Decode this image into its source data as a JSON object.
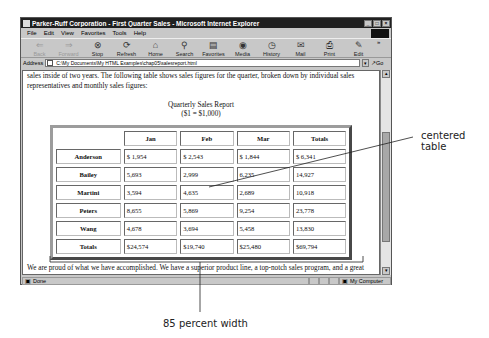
{
  "window": {
    "title": "Parker-Ruff Corporation - First Quarter Sales - Microsoft Internet Explorer",
    "controls": [
      "minimize",
      "maximize",
      "close"
    ]
  },
  "menu": [
    "File",
    "Edit",
    "View",
    "Favorites",
    "Tools",
    "Help"
  ],
  "toolbar": [
    {
      "label": "Back",
      "icon": "back-arrow-icon",
      "enabled": false
    },
    {
      "label": "Forward",
      "icon": "forward-arrow-icon",
      "enabled": false
    },
    {
      "label": "Stop",
      "icon": "stop-icon",
      "enabled": true
    },
    {
      "label": "Refresh",
      "icon": "refresh-icon",
      "enabled": true
    },
    {
      "label": "Home",
      "icon": "home-icon",
      "enabled": true
    },
    {
      "label": "Search",
      "icon": "search-icon",
      "enabled": true
    },
    {
      "label": "Favorites",
      "icon": "favorites-icon",
      "enabled": true
    },
    {
      "label": "Media",
      "icon": "media-icon",
      "enabled": true
    },
    {
      "label": "History",
      "icon": "history-icon",
      "enabled": true
    },
    {
      "label": "Mail",
      "icon": "mail-icon",
      "enabled": true
    },
    {
      "label": "Print",
      "icon": "print-icon",
      "enabled": true
    },
    {
      "label": "Edit",
      "icon": "edit-icon",
      "enabled": true
    }
  ],
  "address": {
    "label": "Address",
    "value": "C:\\My Documents\\My HTML Examples\\chap05\\salesreport.html",
    "go_label": "Go"
  },
  "page": {
    "intro": "sales inside of two years. The following table shows sales figures for the quarter, broken down by individual sales representatives and monthly sales figures:",
    "caption_line1": "Quarterly Sales Report",
    "caption_line2": "($1 = $1,000)",
    "table": {
      "headers": [
        "",
        "Jan",
        "Feb",
        "Mar",
        "Totals"
      ],
      "rows": [
        {
          "name": "Anderson",
          "values": [
            "$ 1,954",
            "$ 2,543",
            "$ 1,844",
            "$ 6,341"
          ]
        },
        {
          "name": "Bailey",
          "values": [
            "5,693",
            "2,999",
            "6,235",
            "14,927"
          ]
        },
        {
          "name": "Martini",
          "values": [
            "3,594",
            "4,635",
            "2,689",
            "10,918"
          ]
        },
        {
          "name": "Peters",
          "values": [
            "8,655",
            "5,869",
            "9,254",
            "23,778"
          ]
        },
        {
          "name": "Wang",
          "values": [
            "4,678",
            "3,694",
            "5,458",
            "13,830"
          ]
        },
        {
          "name": "Totals",
          "values": [
            "$24,574",
            "$19,740",
            "$25,480",
            "$69,794"
          ]
        }
      ]
    },
    "outro": "We are proud of what we have accomplished. We have a superior product line, a top-notch sales program, and a great crew of sales representatives. Congratulations on another outstanding quarter! We look forward to seeing even higher results in the remaining quarters!"
  },
  "status": {
    "text": "Done",
    "zone": "My Computer"
  },
  "callouts": {
    "centered": "centered table",
    "width": "85 percent width"
  }
}
